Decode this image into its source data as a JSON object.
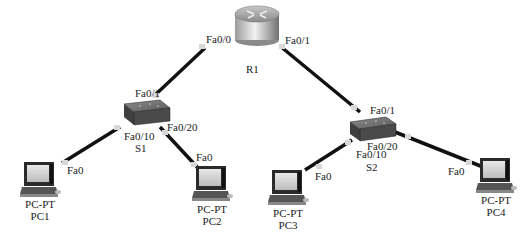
{
  "devices": {
    "router": {
      "name": "R1",
      "port_left": "Fa0/0",
      "port_right": "Fa0/1"
    },
    "switch1": {
      "name": "S1",
      "port_up": "Fa0/1",
      "port_left": "Fa0/10",
      "port_right": "Fa0/20"
    },
    "switch2": {
      "name": "S2",
      "port_up": "Fa0/1",
      "port_left": "Fa0/10",
      "port_right": "Fa0/20"
    },
    "pc1": {
      "type": "PC-PT",
      "name": "PC1",
      "port": "Fa0"
    },
    "pc2": {
      "type": "PC-PT",
      "name": "PC2",
      "port": "Fa0"
    },
    "pc3": {
      "type": "PC-PT",
      "name": "PC3",
      "port": "Fa0"
    },
    "pc4": {
      "type": "PC-PT",
      "name": "PC4",
      "port": "Fa0"
    }
  },
  "links": [
    {
      "from": "R1 Fa0/0",
      "to": "S1 Fa0/1"
    },
    {
      "from": "R1 Fa0/1",
      "to": "S2 Fa0/1"
    },
    {
      "from": "S1 Fa0/10",
      "to": "PC1 Fa0"
    },
    {
      "from": "S1 Fa0/20",
      "to": "PC2 Fa0"
    },
    {
      "from": "S2 Fa0/10",
      "to": "PC3 Fa0"
    },
    {
      "from": "S2 Fa0/20",
      "to": "PC4 Fa0"
    }
  ],
  "colors": {
    "cable": "#111111",
    "connector": "#d8d8d8"
  }
}
